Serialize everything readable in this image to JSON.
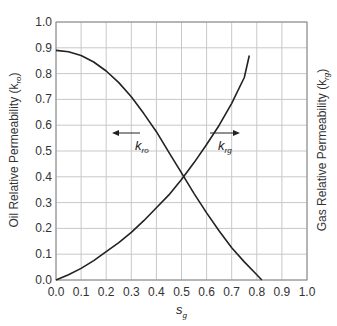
{
  "chart_data": {
    "type": "line",
    "title": "",
    "xlabel": "s",
    "xlabel_subscript": "g",
    "ylabel_left": "Oil Relative Permeability (k",
    "ylabel_left_subscript": "ro",
    "ylabel_right": "Gas Relative Permeability (k",
    "ylabel_right_subscript": "rg",
    "xlim": [
      0.0,
      1.0
    ],
    "ylim": [
      0.0,
      1.0
    ],
    "x_ticks": [
      "0.0",
      "0.1",
      "0.2",
      "0.3",
      "0.4",
      "0.5",
      "0.6",
      "0.7",
      "0.8",
      "0.9",
      "1.0"
    ],
    "y_ticks": [
      "0.0",
      "0.1",
      "0.2",
      "0.3",
      "0.4",
      "0.5",
      "0.6",
      "0.7",
      "0.8",
      "0.9",
      "1.0"
    ],
    "grid": true,
    "legend": "none",
    "series": [
      {
        "name": "k_ro",
        "label": "k",
        "label_subscript": "ro",
        "arrow_direction": "left",
        "x": [
          0.0,
          0.05,
          0.1,
          0.15,
          0.2,
          0.25,
          0.3,
          0.35,
          0.4,
          0.45,
          0.5,
          0.55,
          0.6,
          0.65,
          0.7,
          0.75,
          0.8,
          0.82
        ],
        "y": [
          0.89,
          0.885,
          0.87,
          0.845,
          0.81,
          0.765,
          0.71,
          0.645,
          0.575,
          0.495,
          0.415,
          0.335,
          0.26,
          0.19,
          0.125,
          0.07,
          0.02,
          0.0
        ]
      },
      {
        "name": "k_rg",
        "label": "k",
        "label_subscript": "rg",
        "arrow_direction": "right",
        "x": [
          0.0,
          0.05,
          0.1,
          0.15,
          0.2,
          0.25,
          0.3,
          0.35,
          0.4,
          0.45,
          0.5,
          0.55,
          0.6,
          0.65,
          0.7,
          0.75,
          0.77
        ],
        "y": [
          0.0,
          0.02,
          0.045,
          0.075,
          0.11,
          0.145,
          0.185,
          0.23,
          0.28,
          0.33,
          0.39,
          0.455,
          0.525,
          0.6,
          0.685,
          0.785,
          0.87
        ]
      }
    ],
    "annotations": [
      {
        "text": "k_ro",
        "x": 0.33,
        "y": 0.46,
        "arrow": "left"
      },
      {
        "text": "k_rg",
        "x": 0.62,
        "y": 0.46,
        "arrow": "right"
      }
    ]
  },
  "colors": {
    "curve": "#222222",
    "grid": "#c8c8c8",
    "frame": "#888888",
    "text": "#333333"
  }
}
